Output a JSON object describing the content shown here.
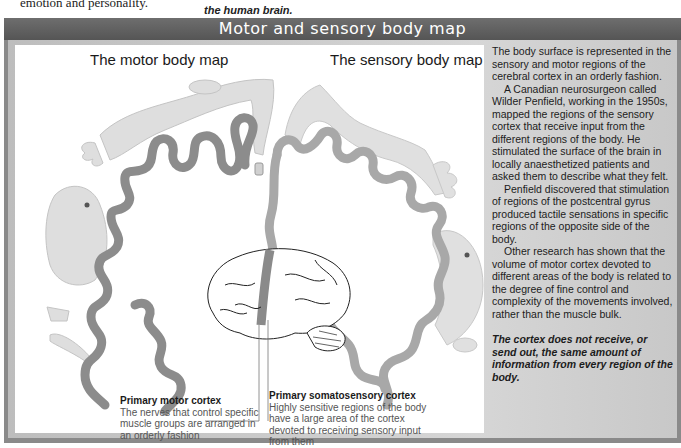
{
  "page_fragments": {
    "top_left_text": "emotion and personality.",
    "top_middle_text": "the human brain."
  },
  "panel": {
    "title": "Motor and sensory body map",
    "figure": {
      "motor_heading": "The motor body map",
      "sensory_heading": "The sensory body map",
      "callouts": [
        {
          "title": "Primary motor cortex",
          "text": "The nerves that control specific muscle groups are arranged in an orderly fashion"
        },
        {
          "title": "Primary somatosensory cortex",
          "text": "Highly sensitive regions of the body have a large area of the cortex devoted to receiving sensory input from them"
        }
      ]
    },
    "sidebar": {
      "paragraphs": [
        "The body surface is represented in the sensory and motor regions of the cerebral cortex in an orderly fashion.",
        "A Canadian neurosurgeon called Wilder Penfield, working in the 1950s, mapped the regions of the sensory cortex that receive input from the different regions of the body. He stimulated the surface of the brain in locally anaesthetized patients and asked them to describe what they felt.",
        "Penfield discovered that stimulation of regions of the postcentral gyrus produced tactile sensations in specific regions of the opposite side of the body.",
        "Other research has shown that the volume of motor cortex devoted to different areas of the body is related to the degree of fine control and complexity of the movements involved, rather than the muscle bulk."
      ],
      "conclusion": "The cortex does not receive, or send out, the same amount of information from every region of the body."
    }
  },
  "colors": {
    "title_bar": "#5f5f5f",
    "cortex_motor": "#8c8c8c",
    "cortex_sensory": "#a9a9a9",
    "homunculus": "#dcdcdc"
  }
}
